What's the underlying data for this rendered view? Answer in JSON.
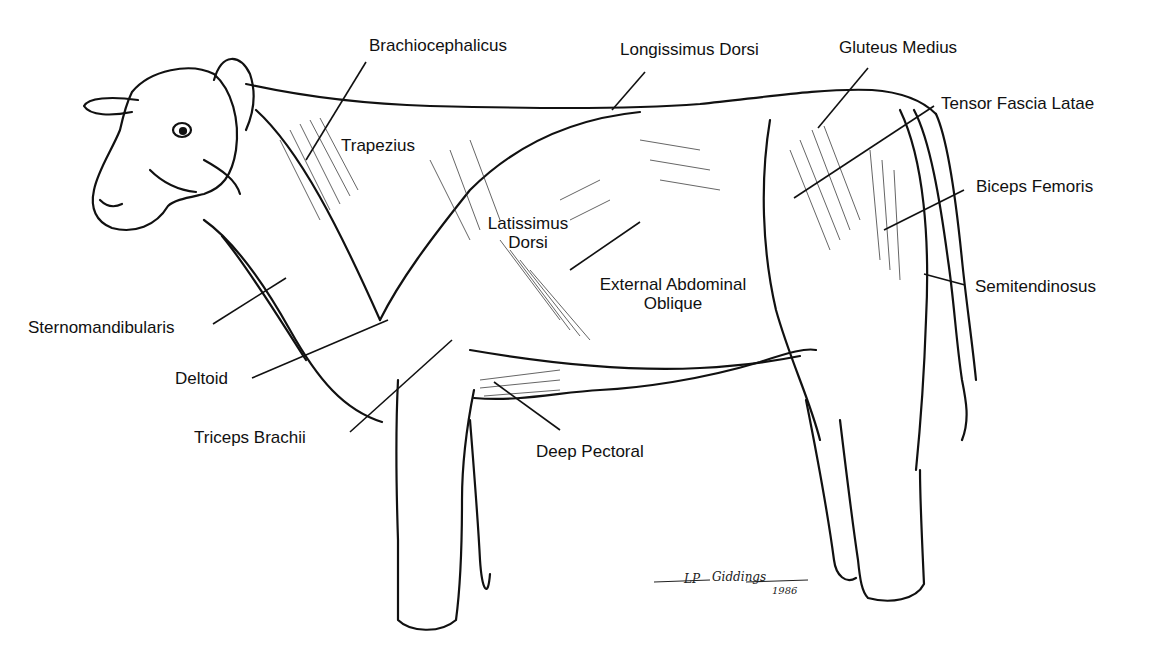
{
  "diagram": {
    "labels": {
      "brachiocephalicus": "Brachiocephalicus",
      "longissimus_dorsi": "Longissimus Dorsi",
      "gluteus_medius": "Gluteus Medius",
      "tensor_fascia_latae": "Tensor Fascia Latae",
      "trapezius": "Trapezius",
      "biceps_femoris": "Biceps Femoris",
      "latissimus_dorsi_1": "Latissimus",
      "latissimus_dorsi_2": "Dorsi",
      "external_abdominal_oblique_1": "External Abdominal",
      "external_abdominal_oblique_2": "Oblique",
      "semitendinosus": "Semitendinosus",
      "sternomandibularis": "Sternomandibularis",
      "deltoid": "Deltoid",
      "triceps_brachii": "Triceps Brachii",
      "deep_pectoral": "Deep Pectoral"
    },
    "signature": {
      "initials": "LP",
      "name": "Giddings",
      "year": "1986"
    },
    "colors": {
      "ink": "#111111",
      "paper": "#ffffff"
    }
  }
}
